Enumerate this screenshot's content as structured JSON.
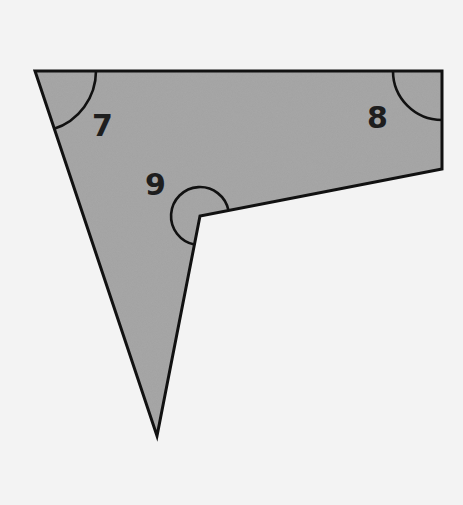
{
  "diagram": {
    "type": "concave-quadrilateral",
    "colors": {
      "background": "#f3f3f3",
      "fill": "#a3a3a3",
      "stroke": "#111111",
      "label": "#1e1e1e"
    },
    "vertices": [
      {
        "id": "top-left",
        "x": 35,
        "y": 71
      },
      {
        "id": "top-right",
        "x": 442,
        "y": 71
      },
      {
        "id": "right-lower",
        "x": 442,
        "y": 169
      },
      {
        "id": "reflex",
        "x": 200,
        "y": 216
      },
      {
        "id": "bottom",
        "x": 157,
        "y": 436
      }
    ],
    "angles": [
      {
        "label": "7",
        "vertex": "top-left",
        "label_x": 92,
        "label_y": 136
      },
      {
        "label": "8",
        "vertex": "top-right",
        "label_x": 367,
        "label_y": 128
      },
      {
        "label": "9",
        "vertex": "reflex",
        "label_x": 145,
        "label_y": 195
      }
    ]
  }
}
